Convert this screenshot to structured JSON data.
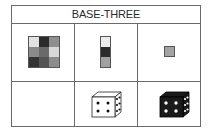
{
  "header": {
    "title": "BASE-THREE"
  },
  "grid_3x3": {
    "colors": [
      "#e2e2e2",
      "#2b2b2b",
      "#8f8f8f",
      "#8a8a8a",
      "#6a6a6a",
      "#d8d8d8",
      "#333333",
      "#555555",
      "#8c8c8c"
    ]
  },
  "column_3x1": {
    "colors": [
      "#ececec",
      "#2a2a2a",
      "#a0a0a0"
    ]
  },
  "single_cell": {
    "color": "#a3a3a3"
  },
  "dice": {
    "white_die": {
      "front_face_dots": 4,
      "side_face_dots": 6,
      "fill": "#ffffff",
      "dot": "#111111"
    },
    "black_die": {
      "front_face_dots": 4,
      "side_face_dots": 6,
      "fill": "#1a1a1a",
      "dot": "#ffffff"
    }
  }
}
